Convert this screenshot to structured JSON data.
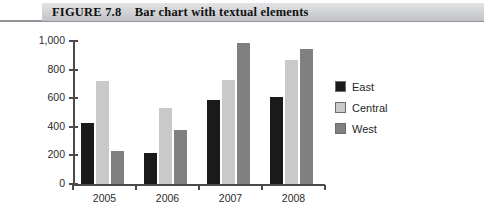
{
  "figure": {
    "label": "FIGURE 7.8",
    "title": "Bar chart with textual elements",
    "caption_full": "FIGURE 7.8    Bar chart with textual elements"
  },
  "colors": {
    "east": "#1a1a1a",
    "central": "#c9c9c9",
    "west": "#808080",
    "axis": "#4a4a4a",
    "caption_band": "#cfd1d4",
    "text": "#1f1f1f"
  },
  "chart_data": {
    "type": "bar",
    "title": "Bar chart with textual elements",
    "xlabel": "",
    "ylabel": "",
    "categories": [
      "2005",
      "2006",
      "2007",
      "2008"
    ],
    "series": [
      {
        "name": "East",
        "color": "#1a1a1a",
        "values": [
          425,
          220,
          585,
          610
        ]
      },
      {
        "name": "Central",
        "color": "#c9c9c9",
        "values": [
          720,
          530,
          725,
          865
        ]
      },
      {
        "name": "West",
        "color": "#808080",
        "values": [
          230,
          375,
          985,
          945
        ]
      }
    ],
    "ylim": [
      0,
      1000
    ],
    "yticks": [
      0,
      200,
      400,
      600,
      800,
      1000
    ],
    "ytick_labels": [
      "0",
      "200",
      "400",
      "600",
      "800",
      "1,000"
    ],
    "grid": false,
    "legend_position": "right"
  }
}
